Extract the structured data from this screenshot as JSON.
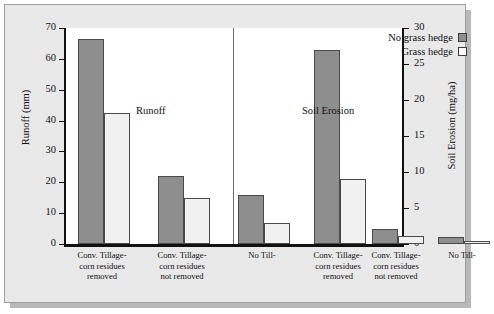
{
  "chart_data": {
    "type": "bar",
    "title": "",
    "panels": [
      {
        "name": "Runoff",
        "label": "Runoff",
        "axis": "left",
        "ylabel": "Runoff (mm)",
        "ylim": [
          0,
          70
        ],
        "yticks": [
          0,
          10,
          20,
          30,
          40,
          50,
          60,
          70
        ],
        "categories": [
          "Conv. Tillage-corn residues removed",
          "Conv. Tillage-corn residues not removed",
          "No Till-"
        ],
        "series": [
          {
            "name": "No grass hedge",
            "values": [
              66.5,
              22.0,
              16.0
            ]
          },
          {
            "name": "Grass hedge",
            "values": [
              42.5,
              15.0,
              6.7
            ]
          }
        ]
      },
      {
        "name": "Soil Erosion",
        "label": "Soil Erosion",
        "axis": "right",
        "ylabel": "Soil Erosion (mg/ha)",
        "ylim": [
          0,
          30
        ],
        "yticks": [
          0,
          5,
          10,
          15,
          20,
          25,
          30
        ],
        "categories": [
          "Conv. Tillage-corn residues removed",
          "Conv. Tillage-corn residues not removed",
          "No Till-"
        ],
        "series": [
          {
            "name": "No grass hedge",
            "values": [
              27.0,
              2.1,
              1.0
            ]
          },
          {
            "name": "Grass hedge",
            "values": [
              9.0,
              1.1,
              0.4
            ]
          }
        ]
      }
    ],
    "legend": {
      "position": "top-right",
      "entries": [
        {
          "label": "No grass hedge",
          "swatch": "filled",
          "color": "#8e8e8e"
        },
        {
          "label": "Grass hedge",
          "swatch": "hollow",
          "color": "#ffffff"
        }
      ]
    },
    "grid": false,
    "colors": {
      "no_grass_hedge": "#8e8e8e",
      "grass_hedge": "#f1f1f1",
      "axis": "#111111",
      "background": "#e9e9e9",
      "plot_background": "#ffffff"
    }
  },
  "axes": {
    "left": {
      "label": "Runoff (mm)",
      "ticks": [
        "70",
        "60",
        "50",
        "40",
        "30",
        "20",
        "10",
        "0"
      ]
    },
    "right": {
      "label": "Soil Erosion (mg/ha)",
      "ticks": [
        "30",
        "25",
        "20",
        "15",
        "10",
        "5",
        "0"
      ]
    }
  },
  "panel_titles": {
    "left": "Runoff",
    "right": "Soil Erosion"
  },
  "category_labels": [
    {
      "line1": "Conv. Tillage-",
      "line2": "corn residues",
      "line3": "removed"
    },
    {
      "line1": "Conv. Tillage-",
      "line2": "corn residues",
      "line3": "not removed"
    },
    {
      "line1": "No Till-",
      "line2": "",
      "line3": ""
    },
    {
      "line1": "Conv. Tillage-",
      "line2": "corn residues",
      "line3": "removed"
    },
    {
      "line1": "Conv. Tillage-",
      "line2": "corn residues",
      "line3": "not removed"
    },
    {
      "line1": "No Till-",
      "line2": "",
      "line3": ""
    }
  ],
  "legend": {
    "entries": [
      {
        "label": "No grass hedge"
      },
      {
        "label": "Grass hedge"
      }
    ]
  }
}
